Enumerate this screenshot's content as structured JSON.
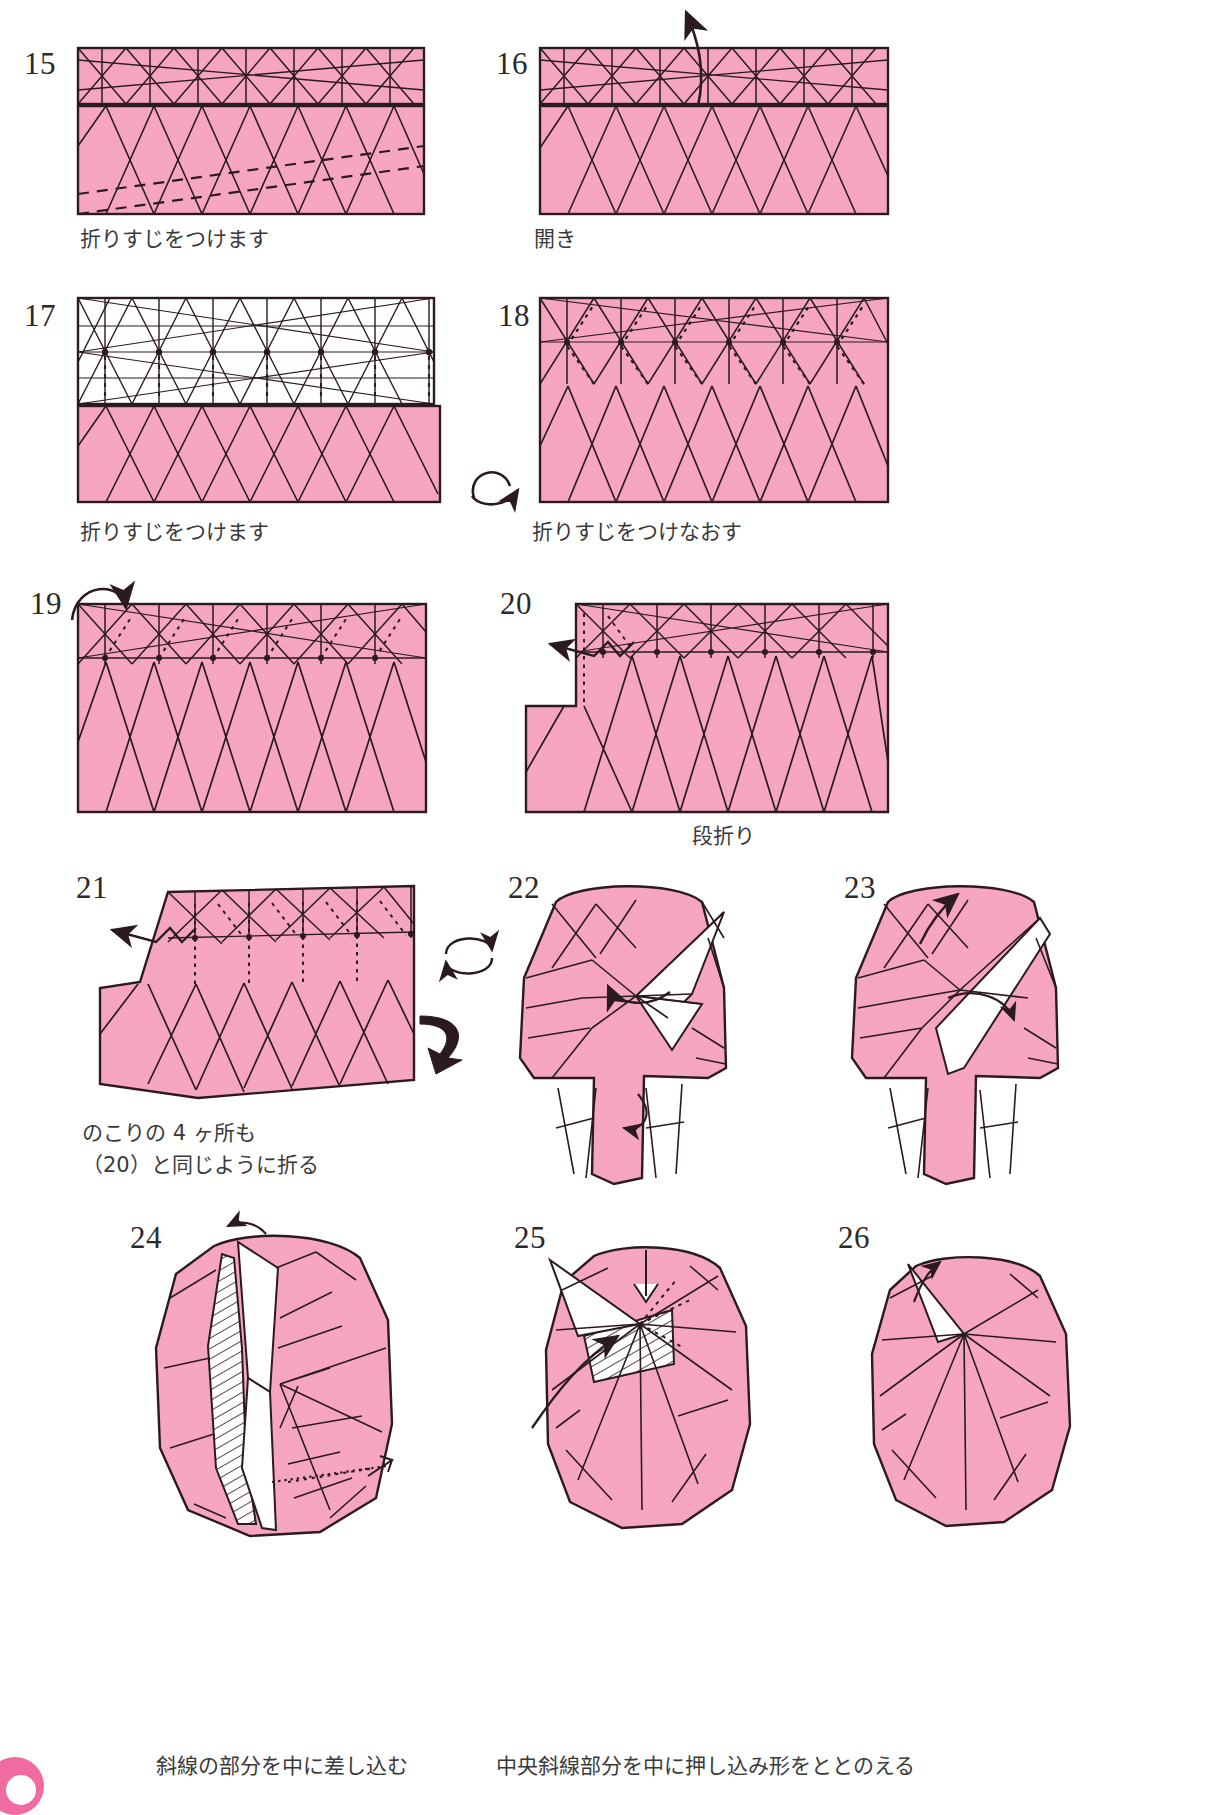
{
  "page": {
    "kind": "origami-instruction-sheet",
    "language": "ja",
    "paper_color": "#f7a8c0",
    "paper_color_shade": "#f09ab6",
    "paper_back_color": "#ffffff",
    "line_color": "#2b1a1e",
    "text_color": "#3a3a3a",
    "total_steps_shown": 12
  },
  "steps": [
    {
      "number": "15",
      "caption": "折りすじをつけます",
      "shape": "rectangle-two-bands",
      "notes": "上段に細かい折りすじ、下段に谷折り(破線)の斜線"
    },
    {
      "number": "16",
      "caption": "開き",
      "shape": "rectangle-two-bands",
      "notes": "上へ開く曲線矢印"
    },
    {
      "number": "17",
      "caption": "折りすじをつけます",
      "shape": "rectangle-white-top-band",
      "notes": "上段は裏(白)で格子状の折りすじ、点線の谷折り"
    },
    {
      "number": "18",
      "caption": "折りすじをつけなおす",
      "shape": "rectangle-full-pink",
      "notes": "裏返しマーク、点線の折りすじをつけなおす"
    },
    {
      "number": "19",
      "caption": "",
      "shape": "rectangle-full-pink",
      "notes": "左上に折り込み矢印"
    },
    {
      "number": "20",
      "caption": "段折り",
      "shape": "rectangle-notched-left",
      "notes": "段折り記号(ジグザグ矢印)"
    },
    {
      "number": "21",
      "caption": "のこりの 4 ヶ所も\n（20）と同じように折る",
      "shape": "slanted-block",
      "notes": "回転マークと裏返し矢印"
    },
    {
      "number": "22",
      "caption": "",
      "shape": "rounded-body-split",
      "notes": "中央に白い三角フラップ、下部に二股"
    },
    {
      "number": "23",
      "caption": "",
      "shape": "rounded-body-split",
      "notes": "白い細長いフラップを起こす"
    },
    {
      "number": "24",
      "caption": "斜線の部分を中に差し込む",
      "shape": "rounded-body-hatched",
      "notes": "左側に斜線(ハッチング)部分、差し込み矢印"
    },
    {
      "number": "25",
      "caption": "中央斜線部分を中に押し込み形をととのえる",
      "shape": "rounded-body-hatched-center",
      "notes": "中央に斜線部分、押し込み矢印(白抜き)"
    },
    {
      "number": "26",
      "caption": "",
      "shape": "rounded-body-finished",
      "notes": "仕上がり直前の形"
    }
  ],
  "symbols": {
    "turn_over": "裏返しマーク",
    "rotate": "回転マーク",
    "open_arrow": "開き矢印",
    "step_fold": "段折り矢印",
    "push_in": "押し込み矢印"
  },
  "captions_bottom": {
    "left": "斜線の部分を中に差し込む",
    "right": "中央斜線部分を中に押し込み形をととのえる"
  }
}
